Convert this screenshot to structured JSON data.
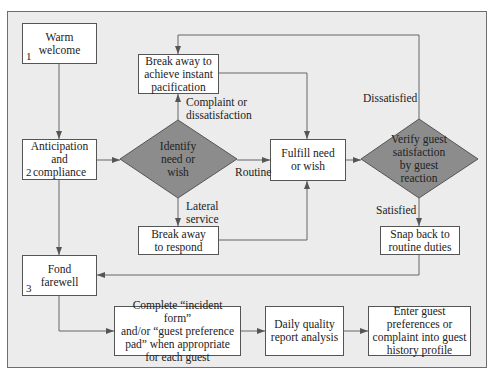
{
  "diagram": {
    "type": "flowchart",
    "colors": {
      "background": "#ececec",
      "box_fill": "#ffffff",
      "decision_fill": "#8c8c8c",
      "line": "#555555"
    },
    "nodes": {
      "warm_welcome": {
        "text": "Warm\nwelcome",
        "number": "1"
      },
      "anticipation": {
        "text": "Anticipation\nand\ncompliance",
        "number": "2"
      },
      "fond_farewell": {
        "text": "Fond\nfarewell",
        "number": "3"
      },
      "identify": {
        "text": "Identify\nneed or\nwish"
      },
      "pacification": {
        "text": "Break away to\nachieve instant\npacification"
      },
      "respond": {
        "text": "Break away\nto respond"
      },
      "fulfill": {
        "text": "Fulfill need\nor wish"
      },
      "verify": {
        "text": "Verify guest\nsatisfaction\nby guest\nreaction"
      },
      "snap_back": {
        "text": "Snap back to\nroutine duties"
      },
      "incident_form": {
        "text": "Complete “incident form”\nand/or “guest preference\npad” when appropriate\nfor each guest"
      },
      "daily_quality": {
        "text": "Daily quality\nreport analysis"
      },
      "enter_guest": {
        "text": "Enter guest\npreferences or\ncomplaint into guest\nhistory profile"
      }
    },
    "edge_labels": {
      "complaint": "Complaint or\ndissatisfaction",
      "routine": "Routine",
      "lateral": "Lateral\nservice",
      "dissatisfied": "Dissatisfied",
      "satisfied": "Satisfied"
    }
  }
}
